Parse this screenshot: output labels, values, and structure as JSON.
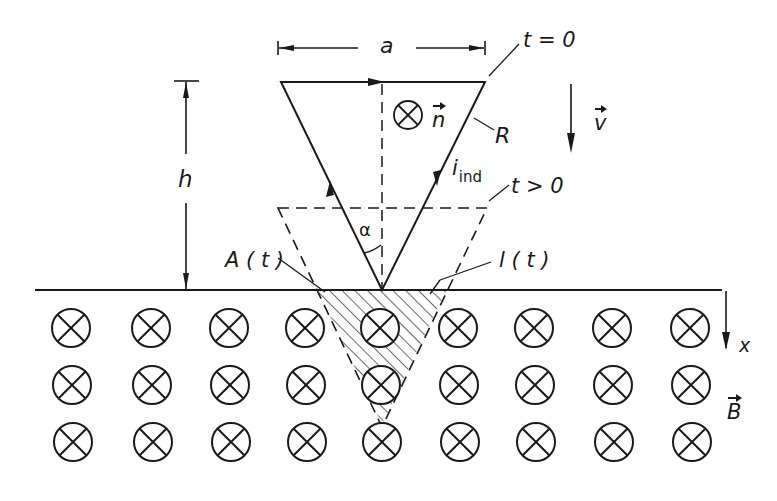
{
  "figure": {
    "colors": {
      "ink": "#1a1a1a",
      "background": "#ffffff"
    }
  },
  "labels": {
    "width": "a",
    "height": "h",
    "time_initial": "t = 0",
    "time_later": "t > 0",
    "resistance": "R",
    "normal_vector": "n",
    "velocity": "v",
    "induced_current_base": "i",
    "induced_current_sub": "ind",
    "angle": "α",
    "area": "A ( t )",
    "length": "l ( t )",
    "axis": "x",
    "field": "B"
  },
  "symbols": {
    "normal_marker": "into-page-symbol",
    "field_marker": "into-page-symbol",
    "field_grid": {
      "rows": 3,
      "columns": 9,
      "column_x": [
        71,
        151,
        229,
        305,
        380,
        458,
        534,
        612,
        690
      ],
      "row_y": [
        328,
        385,
        442
      ],
      "radius": 19
    }
  }
}
